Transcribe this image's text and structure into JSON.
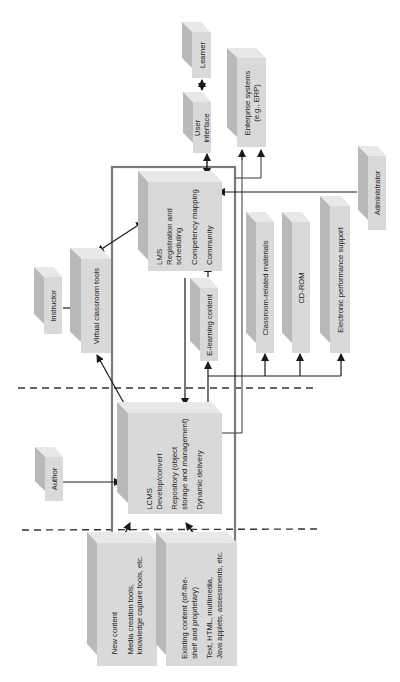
{
  "diagram": {
    "title": "",
    "colors": {
      "box_front": "#d9d9d9",
      "box_side": "#b9b9b9",
      "box_top": "#e8e8e8",
      "frame": "#777777",
      "line": "#1a1a1a",
      "dashed": "#333333"
    },
    "nodes": {
      "learner": {
        "label": "Learner"
      },
      "user_interface": {
        "line1": "User",
        "line2": "interface"
      },
      "enterprise": {
        "line1": "Enterprise systems",
        "line2": "(e.g., ERP)"
      },
      "lms": {
        "line1": "LMS",
        "line2": "Registration and",
        "line3": "scheduling",
        "line4": "Competency mapping",
        "line5": "Community"
      },
      "administrator": {
        "label": "Administrator"
      },
      "classroom_materials": {
        "label": "Classroom-related materials"
      },
      "cdrom": {
        "label": "CD-ROM"
      },
      "eps": {
        "label": "Electronic performance support"
      },
      "instructor": {
        "label": "Instructor"
      },
      "virtual_classroom": {
        "label": "Virtual classroom tools"
      },
      "elearning": {
        "label": "E-learning content"
      },
      "lcms": {
        "line1": "LCMS",
        "line2": "Develop/convert",
        "line3": "Repository (object",
        "line4": "storage and management)",
        "line5": "Dynamic delivery"
      },
      "author": {
        "label": "Author"
      },
      "new_content": {
        "line1": "New content",
        "line2": "Media creation tools,",
        "line3": "knowledge capture tools, etc."
      },
      "existing_content": {
        "line1": "Existing content (off-the-",
        "line2": "shelf and proprietary)",
        "line3": "Text, HTML, multimedia,",
        "line4": "Java applets, assessments, etc."
      }
    },
    "edges": [
      {
        "from": "learner",
        "to": "user_interface",
        "type": "bidirectional"
      },
      {
        "from": "user_interface",
        "to": "lms",
        "type": "bidirectional"
      },
      {
        "from": "frame",
        "to": "enterprise",
        "type": "arrow"
      },
      {
        "from": "administrator",
        "to": "lms",
        "type": "arrow"
      },
      {
        "from": "instructor",
        "to": "virtual_classroom",
        "type": "arrow"
      },
      {
        "from": "virtual_classroom",
        "to": "lms",
        "type": "bidirectional"
      },
      {
        "from": "virtual_classroom",
        "to": "lcms",
        "type": "bidirectional"
      },
      {
        "from": "elearning",
        "to": "lms",
        "type": "arrow"
      },
      {
        "from": "lms",
        "to": "lcms",
        "type": "arrow"
      },
      {
        "from": "lcms",
        "to": "elearning",
        "type": "arrow"
      },
      {
        "from": "lcms",
        "to": "classroom_materials",
        "type": "arrow"
      },
      {
        "from": "lcms",
        "to": "cdrom",
        "type": "arrow"
      },
      {
        "from": "lcms",
        "to": "eps",
        "type": "arrow"
      },
      {
        "from": "author",
        "to": "lcms",
        "type": "arrow"
      },
      {
        "from": "lcms",
        "to": "new_content",
        "type": "bidirectional"
      },
      {
        "from": "lcms",
        "to": "existing_content",
        "type": "bidirectional"
      }
    ]
  }
}
